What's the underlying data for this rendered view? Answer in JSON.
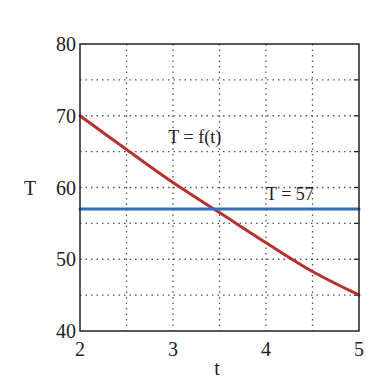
{
  "chart_data": {
    "type": "line",
    "title": "",
    "xlabel": "t",
    "ylabel": "T",
    "xlim": [
      2,
      5
    ],
    "ylim": [
      40,
      80
    ],
    "xticks": [
      2,
      3,
      4,
      5
    ],
    "yticks": [
      40,
      50,
      60,
      70,
      80
    ],
    "grid": "dotted, minor every 0.5 in t and 5 in T",
    "legend": "none",
    "series": [
      {
        "name": "T = f(t)",
        "color": "#b5322e",
        "x": [
          2,
          2.5,
          3,
          3.5,
          4,
          4.5,
          5
        ],
        "y": [
          70,
          65.3,
          60.7,
          56.5,
          52.3,
          48.3,
          45
        ]
      },
      {
        "name": "T = 57",
        "color": "#2d6fc4",
        "x": [
          2,
          5
        ],
        "y": [
          57,
          57
        ]
      }
    ],
    "annotations": [
      {
        "text": "T = f(t)",
        "x": 2.95,
        "y": 66.2
      },
      {
        "text": "T = 57",
        "x": 4.0,
        "y": 58.3
      }
    ]
  }
}
